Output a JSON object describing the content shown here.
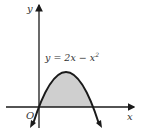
{
  "diagram": {
    "equation": "y = 2x − x",
    "equation_exponent": "2",
    "axis_x_label": "x",
    "axis_y_label": "y",
    "origin_label": "O",
    "shaded_region": "area under y = 2x − x² between x = 0 and x = 2",
    "colors": {
      "stroke": "#1a1a1a",
      "fill": "#cfcfcf",
      "background": "#ffffff"
    }
  }
}
